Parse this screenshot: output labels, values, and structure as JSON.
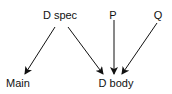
{
  "nodes": {
    "dspec": {
      "label": "D spec",
      "x": 60,
      "y": 9
    },
    "p": {
      "label": "P",
      "x": 113,
      "y": 9
    },
    "q": {
      "label": "Q",
      "x": 158,
      "y": 9
    },
    "main": {
      "label": "Main",
      "x": 18,
      "y": 77
    },
    "dbody": {
      "label": "D body",
      "x": 116,
      "y": 77
    }
  },
  "edges": [
    {
      "from": "D spec",
      "to": "Main"
    },
    {
      "from": "D spec",
      "to": "D body"
    },
    {
      "from": "P",
      "to": "D body"
    },
    {
      "from": "Q",
      "to": "D body"
    }
  ],
  "colors": {
    "line": "#111111",
    "text": "#111111"
  }
}
